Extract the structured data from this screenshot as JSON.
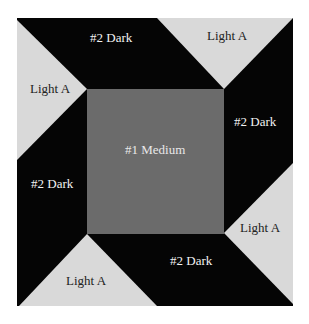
{
  "diagram": {
    "type": "quilt-block",
    "colors": {
      "background": "#ffffff",
      "dark": "#050505",
      "medium": "#6b6b6b",
      "light": "#d9d9d9"
    },
    "labels": {
      "center": "#1 Medium",
      "dark_top": "#2 Dark",
      "dark_right": "#2 Dark",
      "dark_bottom": "#2 Dark",
      "dark_left": "#2 Dark",
      "light_top": "Light A",
      "light_right": "Light A",
      "light_bottom": "Light A",
      "light_left": "Light A"
    }
  }
}
